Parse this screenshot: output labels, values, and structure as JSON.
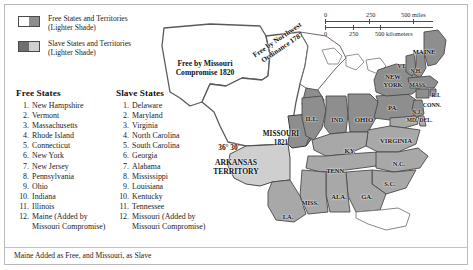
{
  "legend": {
    "items": [
      {
        "label_line1": "Free States and Territories",
        "label_line2": "(Lighter Shade)",
        "swatch": "free-swatch"
      },
      {
        "label_line1": "Slave States and Territories",
        "label_line2": "(Lighter Shade)",
        "swatch": "slave-swatch"
      }
    ]
  },
  "free_states": {
    "title": "Free States",
    "items": [
      {
        "num": "1.",
        "name": "New Hampshire"
      },
      {
        "num": "2.",
        "name": "Vermont"
      },
      {
        "num": "3.",
        "name": "Massachusetts"
      },
      {
        "num": "4.",
        "name": "Rhode Island"
      },
      {
        "num": "5.",
        "name": "Connecticut"
      },
      {
        "num": "6.",
        "name": "New York"
      },
      {
        "num": "7.",
        "name": "New Jersey"
      },
      {
        "num": "8.",
        "name": "Pennsylvania"
      },
      {
        "num": "9.",
        "name": "Ohio"
      },
      {
        "num": "10.",
        "name": "Indiana"
      },
      {
        "num": "11.",
        "name": "Illinois"
      },
      {
        "num": "12.",
        "name": "Maine (Added by",
        "cont": "Missouri Compromise)"
      }
    ]
  },
  "slave_states": {
    "title": "Slave States",
    "items": [
      {
        "num": "1.",
        "name": "Delaware"
      },
      {
        "num": "2.",
        "name": "Maryland"
      },
      {
        "num": "3.",
        "name": "Virginia"
      },
      {
        "num": "4.",
        "name": "North Carolina"
      },
      {
        "num": "5.",
        "name": "South Carolina"
      },
      {
        "num": "6.",
        "name": "Georgia"
      },
      {
        "num": "7.",
        "name": "Alabama"
      },
      {
        "num": "8.",
        "name": "Mississippi"
      },
      {
        "num": "9.",
        "name": "Louisiana"
      },
      {
        "num": "10.",
        "name": "Kentucky"
      },
      {
        "num": "11.",
        "name": "Tennessee"
      },
      {
        "num": "12.",
        "name": "Missouri (Added by",
        "cont": "Missouri Compromise)"
      }
    ]
  },
  "caption": "Maine Added as Free, and Missouri, as Slave",
  "scale": {
    "miles": {
      "t0": "0",
      "t1": "250",
      "t2": "500 miles"
    },
    "kilometers": {
      "t0": "0",
      "t1": "250",
      "t2": "500 kilometers"
    }
  },
  "map": {
    "region_labels": [
      {
        "id": "free-missouri-compromise",
        "line1": "Free by Missouri",
        "line2": "Compromise 1820",
        "x": 55,
        "y": 62,
        "size": 7.6,
        "style": "blk"
      },
      {
        "id": "free-northwest-ordinance",
        "line1": "Free by Northwest",
        "line2": "Ordinance 1787",
        "x": 130,
        "y": 38,
        "size": 7.2,
        "style": "blk",
        "rotate": -34
      },
      {
        "id": "parallel-36-30",
        "line1": "36° 30'",
        "line2": "",
        "x": 79,
        "y": 141,
        "size": 7.4,
        "style": "blk"
      },
      {
        "id": "arkansas-territory",
        "line1": "ARKANSAS",
        "line2": "TERRITORY",
        "x": 86,
        "y": 161,
        "size": 7.6,
        "style": "blk"
      },
      {
        "id": "missouri-1821",
        "line1": "MISSOURI",
        "line2": "1821",
        "x": 131,
        "y": 133,
        "size": 7.2,
        "style": "blk"
      }
    ],
    "state_labels": [
      {
        "id": "maine",
        "text": "MAINE",
        "x": 274,
        "y": 45,
        "size": 6.6,
        "style": "blk"
      },
      {
        "id": "vermont",
        "text": "VT.",
        "x": 252,
        "y": 60,
        "size": 5.6,
        "style": "blk"
      },
      {
        "id": "new-hampshire",
        "text": "N.H.",
        "x": 266,
        "y": 65,
        "size": 5.6,
        "style": "blk"
      },
      {
        "id": "massachusetts",
        "text": "MASS.",
        "x": 268,
        "y": 79,
        "size": 5.6,
        "style": "blk"
      },
      {
        "id": "rhode-island",
        "text": "R.I.",
        "x": 286,
        "y": 89,
        "size": 5.6,
        "style": "blk"
      },
      {
        "id": "connecticut",
        "text": "CONN.",
        "x": 282,
        "y": 99,
        "size": 5.8,
        "style": "blk"
      },
      {
        "id": "new-york",
        "text": "NEW",
        "x": 243,
        "y": 70,
        "size": 6.4,
        "style": "blk"
      },
      {
        "id": "new-york-2",
        "text": "YORK",
        "x": 243,
        "y": 78,
        "size": 6.4,
        "style": "blk"
      },
      {
        "id": "pennsylvania",
        "text": "PA.",
        "x": 243,
        "y": 101,
        "size": 6.6,
        "style": "blk"
      },
      {
        "id": "new-jersey",
        "text": "N.J.",
        "x": 267,
        "y": 106,
        "size": 5.4,
        "style": "blk"
      },
      {
        "id": "maryland",
        "text": "MD.",
        "x": 262,
        "y": 114,
        "size": 5.6,
        "style": "blk"
      },
      {
        "id": "delaware",
        "text": "DEL.",
        "x": 276,
        "y": 114,
        "size": 5.6,
        "style": "blk"
      },
      {
        "id": "ohio",
        "text": "OHIO",
        "x": 214,
        "y": 113,
        "size": 6.8,
        "style": "blk"
      },
      {
        "id": "indiana",
        "text": "IND.",
        "x": 188,
        "y": 113,
        "size": 6.4,
        "style": "blk"
      },
      {
        "id": "illinois",
        "text": "ILL.",
        "x": 162,
        "y": 112,
        "size": 6.6,
        "style": "blk"
      },
      {
        "id": "virginia",
        "text": "VIRGINIA",
        "x": 246,
        "y": 134,
        "size": 6.6,
        "style": "blk"
      },
      {
        "id": "kentucky",
        "text": "KY.",
        "x": 200,
        "y": 144,
        "size": 6.6,
        "style": "blk"
      },
      {
        "id": "tennessee",
        "text": "TENN.",
        "x": 186,
        "y": 164,
        "size": 6.4,
        "style": "blk"
      },
      {
        "id": "north-carolina",
        "text": "N.C.",
        "x": 249,
        "y": 157,
        "size": 6.4,
        "style": "blk"
      },
      {
        "id": "south-carolina",
        "text": "S.C.",
        "x": 240,
        "y": 177,
        "size": 6.4,
        "style": "blk"
      },
      {
        "id": "georgia",
        "text": "GA.",
        "x": 217,
        "y": 190,
        "size": 6.6,
        "style": "blk"
      },
      {
        "id": "alabama",
        "text": "ALA.",
        "x": 189,
        "y": 190,
        "size": 6.6,
        "style": "blk"
      },
      {
        "id": "mississippi",
        "text": "MISS.",
        "x": 160,
        "y": 196,
        "size": 6.4,
        "style": "blk"
      },
      {
        "id": "louisiana",
        "text": "LA.",
        "x": 138,
        "y": 210,
        "size": 6.4,
        "style": "blk"
      }
    ],
    "colors": {
      "free_state": "#8e8e8e",
      "free_territory": "#ffffff",
      "slave_state": "#a8a8a8",
      "slave_territory": "#cfcfcf",
      "unorganized": "#ffffff",
      "border": "#4a4a4a",
      "water": "#ffffff"
    }
  }
}
